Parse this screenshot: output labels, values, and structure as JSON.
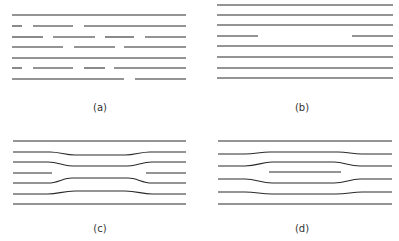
{
  "figure": {
    "width": 399,
    "height": 241,
    "line_color": "#2a2a2a",
    "panels": [
      {
        "id": "a",
        "label": "(a)",
        "label_pos": [
          100,
          111
        ],
        "segments": [
          [
            [
              12,
              15
            ],
            [
              186,
              15
            ]
          ],
          [
            [
              12,
              26
            ],
            [
              22,
              26
            ]
          ],
          [
            [
              33,
              26
            ],
            [
              73,
              26
            ]
          ],
          [
            [
              84,
              26
            ],
            [
              186,
              26
            ]
          ],
          [
            [
              12,
              37
            ],
            [
              43,
              37
            ]
          ],
          [
            [
              53,
              37
            ],
            [
              95,
              37
            ]
          ],
          [
            [
              105,
              37
            ],
            [
              134,
              37
            ]
          ],
          [
            [
              145,
              37
            ],
            [
              186,
              37
            ]
          ],
          [
            [
              12,
              47
            ],
            [
              63,
              47
            ]
          ],
          [
            [
              74,
              47
            ],
            [
              115,
              47
            ]
          ],
          [
            [
              124,
              47
            ],
            [
              186,
              47
            ]
          ],
          [
            [
              12,
              58
            ],
            [
              186,
              58
            ]
          ],
          [
            [
              12,
              68
            ],
            [
              22,
              68
            ]
          ],
          [
            [
              33,
              68
            ],
            [
              73,
              68
            ]
          ],
          [
            [
              84,
              68
            ],
            [
              105,
              68
            ]
          ],
          [
            [
              114,
              68
            ],
            [
              186,
              68
            ]
          ],
          [
            [
              12,
              79
            ],
            [
              124,
              79
            ]
          ],
          [
            [
              135,
              79
            ],
            [
              186,
              79
            ]
          ]
        ],
        "paths": []
      },
      {
        "id": "b",
        "label": "(b)",
        "label_pos": [
          302,
          111
        ],
        "segments": [
          [
            [
              217,
              5
            ],
            [
              393,
              5
            ]
          ],
          [
            [
              217,
              15
            ],
            [
              393,
              15
            ]
          ],
          [
            [
              217,
              25
            ],
            [
              393,
              25
            ]
          ],
          [
            [
              217,
              36
            ],
            [
              258,
              36
            ]
          ],
          [
            [
              352,
              36
            ],
            [
              393,
              36
            ]
          ],
          [
            [
              217,
              46
            ],
            [
              393,
              46
            ]
          ],
          [
            [
              217,
              57
            ],
            [
              393,
              57
            ]
          ],
          [
            [
              217,
              68
            ],
            [
              393,
              68
            ]
          ],
          [
            [
              217,
              78
            ],
            [
              393,
              78
            ]
          ]
        ],
        "paths": []
      },
      {
        "id": "c",
        "label": "(c)",
        "label_pos": [
          100,
          232
        ],
        "segments": [
          [
            [
              13,
              141
            ],
            [
              186,
              141
            ]
          ],
          [
            [
              13,
              173
            ],
            [
              52,
              173
            ]
          ],
          [
            [
              146,
              173
            ],
            [
              186,
              173
            ]
          ],
          [
            [
              13,
              204
            ],
            [
              186,
              204
            ]
          ]
        ],
        "paths": [
          "M13,152 L50,152 C60,152 65,155 75,155 L125,155 C135,155 140,152 150,152 L186,152",
          "M13,162 L48,162 C58,162 63,166 72,166 L128,166 C137,166 142,162 152,162 L186,162",
          "M13,183 L48,183 C58,183 63,178 72,178 L128,178 C137,178 142,183 152,183 L186,183",
          "M13,194 L48,194 C58,194 63,191 75,191 L125,191 C137,191 142,194 152,194 L186,194"
        ]
      },
      {
        "id": "d",
        "label": "(d)",
        "label_pos": [
          302,
          232
        ],
        "segments": [
          [
            [
              218,
              141
            ],
            [
              392,
              141
            ]
          ],
          [
            [
              269,
              172
            ],
            [
              341,
              172
            ]
          ],
          [
            [
              218,
              204
            ],
            [
              392,
              204
            ]
          ]
        ],
        "paths": [
          "M218,154 L245,154 C255,154 260,152 270,152 L338,152 C348,152 352,154 362,154 L392,154",
          "M218,166 L245,166 C257,166 262,162 272,162 L334,162 C344,162 349,166 360,166 L392,166",
          "M218,179 L245,179 C256,179 261,183 272,183 L334,183 C345,183 350,179 360,179 L392,179",
          "M218,192 L245,192 C256,192 261,194 272,194 L336,194 C347,194 352,192 362,192 L392,192"
        ]
      }
    ]
  }
}
